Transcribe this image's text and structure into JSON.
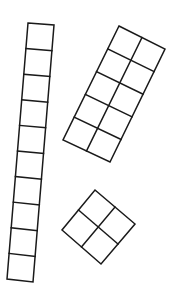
{
  "diagram": {
    "stroke_color": "#1a1a1a",
    "background_color": "#ffffff",
    "shapes": [
      {
        "name": "vertical-strip-1x10",
        "cols": 1,
        "rows": 10,
        "corners": {
          "top_left": [
            28,
            23
          ],
          "top_right": [
            54,
            25
          ],
          "bottom_right": [
            33,
            282
          ],
          "bottom_left": [
            7,
            279
          ]
        }
      },
      {
        "name": "tilted-rect-2x5",
        "cols": 2,
        "rows": 5,
        "corners": {
          "top_left": [
            119,
            26
          ],
          "top_right": [
            165,
            49
          ],
          "bottom_right": [
            110,
            162
          ],
          "bottom_left": [
            63,
            140
          ]
        }
      },
      {
        "name": "diamond-square-2x2",
        "cols": 2,
        "rows": 2,
        "corners": {
          "top_left": [
            95,
            190
          ],
          "top_right": [
            135,
            224
          ],
          "bottom_right": [
            101,
            264
          ],
          "bottom_left": [
            62,
            230
          ]
        }
      }
    ]
  }
}
